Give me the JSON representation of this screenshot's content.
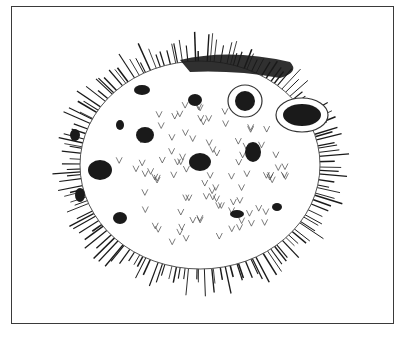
{
  "illustration": {
    "subject": "porcupinefish",
    "style": "pen-and-ink",
    "colors": {
      "ink": "#1a1a1a",
      "line": "#3a3a3a",
      "paper": "#ffffff"
    },
    "body": {
      "cx": 200,
      "cy": 165,
      "rx": 138,
      "ry": 122
    },
    "spines": {
      "count": 150,
      "min_len": 14,
      "max_len": 34
    },
    "inner_marks": {
      "count": 90
    },
    "spots": [
      {
        "cx": 142,
        "cy": 90,
        "rx": 8,
        "ry": 5
      },
      {
        "cx": 195,
        "cy": 100,
        "rx": 7,
        "ry": 6
      },
      {
        "cx": 145,
        "cy": 135,
        "rx": 9,
        "ry": 8
      },
      {
        "cx": 100,
        "cy": 170,
        "rx": 12,
        "ry": 10
      },
      {
        "cx": 200,
        "cy": 162,
        "rx": 11,
        "ry": 9
      },
      {
        "cx": 253,
        "cy": 152,
        "rx": 8,
        "ry": 10
      },
      {
        "cx": 120,
        "cy": 218,
        "rx": 7,
        "ry": 6
      },
      {
        "cx": 237,
        "cy": 214,
        "rx": 7,
        "ry": 4
      },
      {
        "cx": 277,
        "cy": 207,
        "rx": 5,
        "ry": 4
      },
      {
        "cx": 75,
        "cy": 135,
        "rx": 5,
        "ry": 6
      },
      {
        "cx": 80,
        "cy": 195,
        "rx": 5,
        "ry": 7
      },
      {
        "cx": 120,
        "cy": 125,
        "rx": 4,
        "ry": 5
      }
    ],
    "eyes": [
      {
        "cx": 245,
        "cy": 101,
        "rx": 10,
        "ry": 10
      },
      {
        "cx": 302,
        "cy": 115,
        "rx": 19,
        "ry": 11
      }
    ]
  }
}
